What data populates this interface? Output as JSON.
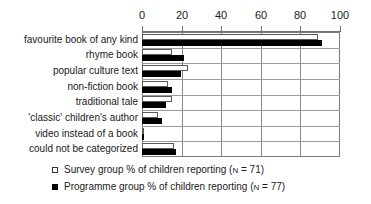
{
  "chart_data": {
    "type": "bar",
    "orientation": "horizontal",
    "title": "",
    "xlabel": "",
    "ylabel": "",
    "xlim": [
      0,
      100
    ],
    "xticks": [
      0,
      20,
      40,
      60,
      80,
      100
    ],
    "xtick_labels": [
      "0",
      "20",
      "40",
      "60",
      "80",
      "100"
    ],
    "grid": true,
    "legend_position": "bottom-left",
    "categories": [
      "favourite book of any kind",
      "rhyme book",
      "popular culture text",
      "non-fiction book",
      "traditional tale",
      "'classic' children's author",
      "video instead of a book",
      "could not be categorized"
    ],
    "series": [
      {
        "name": "Survey group % of children reporting (N = 71)",
        "short_name": "Survey group",
        "color": "#ffffff",
        "edge_color": "#5a5a5a",
        "values": [
          89,
          15,
          23,
          13,
          15,
          8,
          0.5,
          16
        ]
      },
      {
        "name": "Programme group % of children reporting (N = 77)",
        "short_name": "Programme group",
        "color": "#000000",
        "edge_color": "#000000",
        "values": [
          91,
          21,
          19.5,
          15,
          12,
          10,
          1,
          17
        ]
      }
    ]
  },
  "legend": {
    "items": [
      {
        "label_before_n": "Survey group % of children reporting (",
        "n_symbol": "N",
        "label_after_n": " = 71)",
        "full": "Survey group % of children reporting (N = 71)"
      },
      {
        "label_before_n": "Programme group % of children reporting (",
        "n_symbol": "N",
        "label_after_n": " = 77)",
        "full": "Programme group % of children reporting (N = 77)"
      }
    ]
  },
  "colors": {
    "survey_fill": "#ffffff",
    "programme_fill": "#000000",
    "grid": "#8a8a8a",
    "axis": "#6f6f6f",
    "text": "#1a1a1a",
    "background": "#ffffff"
  }
}
